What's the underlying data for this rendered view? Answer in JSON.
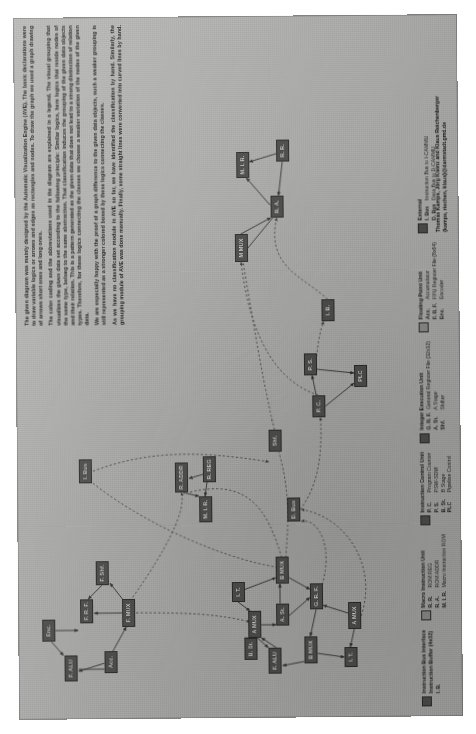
{
  "poster": {
    "title": "CPU Block Diagram (AVE)"
  },
  "description": {
    "paragraphs": [
      "The given diagram was mainly designed by the Automatic Visualization Engine (AVE). The basic declarations were to draw variable logics or arrows and edges as rectangles and nodes. To draw the graph we used a graph drawing of arrows short ones and long ones.",
      "The color coding and the abbreviations used in the diagram are explained in a legend. The visual grouping that visualizes the given data set according to the following principle: Similar logics, here logics that reside nodes of the same type, belong to the same abstraction. That classification induces the grouping of the given data objects and their relation. This is a pattern generated as the given data that does not lead to a strong distinction of relation types. Therefore, for these logics connecting the classes we choose a weaker variation of the nodes of the given data.",
      "We are especially happy with the proof of a graph difference to the given data objects, such a weaker grouping is still represented as a stronger colored boxed by these logics connecting the classes.",
      "As we have no classification module in AVE so far, we have identified the classification by hand. Similarly, the grouping module of AVE was done manually. Finally, some straight lines were converted into curved lines by hand."
    ]
  },
  "credit": {
    "line1": "Thomas Kamps, Jörg Kleinz and Klaus Reichenberger",
    "line2": "{kamps, riechen, klaus}@darmstadt.gmd.de"
  },
  "legend": {
    "groups": [
      {
        "swatch": "dark",
        "title": "Instruction Bus Interface",
        "subtitle": "Instruction Buffer (4x32)",
        "items": [
          {
            "abbr": "I. B.",
            "name": ""
          }
        ]
      },
      {
        "swatch": "light",
        "title": "Macro Instruction Unit",
        "subtitle": "",
        "items": [
          {
            "abbr": "R. R.",
            "name": "ROM REG"
          },
          {
            "abbr": "R. A.",
            "name": "ROM ADDR"
          },
          {
            "abbr": "M. I. R.",
            "name": "Macro Instruction ROM"
          }
        ]
      },
      {
        "swatch": "dark",
        "title": "Instruction Control Unit",
        "subtitle": "",
        "items": [
          {
            "abbr": "P. C.",
            "name": "Program Counter"
          },
          {
            "abbr": "P. S.",
            "name": "PSW-SDW"
          },
          {
            "abbr": "B. St.",
            "name": "B Stage"
          },
          {
            "abbr": "PLC",
            "name": "Pipeline Control"
          }
        ]
      },
      {
        "swatch": "dark",
        "title": "Integer Execution Unit",
        "subtitle": "",
        "items": [
          {
            "abbr": "G. R. F.",
            "name": "General Register File (32x32)"
          },
          {
            "abbr": "A. St.",
            "name": "A Stage"
          },
          {
            "abbr": "Shf.",
            "name": "Shifter"
          }
        ]
      },
      {
        "swatch": "light",
        "title": "Floating Point Unit",
        "subtitle": "",
        "items": [
          {
            "abbr": "Acc.",
            "name": "Accumulator"
          },
          {
            "abbr": "F. R. F.",
            "name": "FPU Register File (8x64)"
          },
          {
            "abbr": "Enc.",
            "name": "Encoder"
          }
        ]
      },
      {
        "swatch": "dark",
        "title": "External",
        "subtitle": "",
        "items": [
          {
            "abbr": "I. Bus",
            "name": "Instruction Bus to I-CAMMU"
          },
          {
            "abbr": "D. Bus",
            "name": "Data Bus to D-CAMMU"
          }
        ]
      }
    ]
  },
  "diagram": {
    "nodes": [
      {
        "id": "n1",
        "label": "F. ALU",
        "x": 38,
        "y": 46,
        "w": 26,
        "h": 13,
        "shade": "dark"
      },
      {
        "id": "n2",
        "label": "Enc.",
        "x": 78,
        "y": 24,
        "w": 22,
        "h": 13,
        "shade": "dark"
      },
      {
        "id": "n3",
        "label": "Acc.",
        "x": 46,
        "y": 86,
        "w": 22,
        "h": 13,
        "shade": "dark"
      },
      {
        "id": "n4",
        "label": "F. R. F.",
        "x": 96,
        "y": 62,
        "w": 24,
        "h": 13,
        "shade": "dark"
      },
      {
        "id": "n5",
        "label": "F. MUX",
        "x": 92,
        "y": 104,
        "w": 28,
        "h": 13,
        "shade": "dark"
      },
      {
        "id": "n6",
        "label": "F. Shf.",
        "x": 134,
        "y": 78,
        "w": 24,
        "h": 13,
        "shade": "dark"
      },
      {
        "id": "n7",
        "label": "I. Bus",
        "x": 236,
        "y": 62,
        "w": 24,
        "h": 13,
        "shade": "dark"
      },
      {
        "id": "n8",
        "label": "R. ADDR",
        "x": 226,
        "y": 158,
        "w": 30,
        "h": 13,
        "shade": "dark"
      },
      {
        "id": "n9",
        "label": "M. I. R.",
        "x": 196,
        "y": 182,
        "w": 26,
        "h": 13,
        "shade": "dark"
      },
      {
        "id": "n10",
        "label": "R. REG",
        "x": 236,
        "y": 186,
        "w": 26,
        "h": 13,
        "shade": "dark"
      },
      {
        "id": "n11",
        "label": "B. St.",
        "x": 58,
        "y": 226,
        "w": 22,
        "h": 13,
        "shade": "dark"
      },
      {
        "id": "n12",
        "label": "I. T.",
        "x": 116,
        "y": 214,
        "w": 20,
        "h": 13,
        "shade": "dark"
      },
      {
        "id": "n13",
        "label": "A MUX",
        "x": 80,
        "y": 230,
        "w": 27,
        "h": 13,
        "shade": "dark"
      },
      {
        "id": "n14",
        "label": "F. ALU",
        "x": 44,
        "y": 250,
        "w": 26,
        "h": 13,
        "shade": "dark"
      },
      {
        "id": "n15",
        "label": "A. St.",
        "x": 92,
        "y": 258,
        "w": 22,
        "h": 13,
        "shade": "dark"
      },
      {
        "id": "n16",
        "label": "B MUX",
        "x": 134,
        "y": 258,
        "w": 27,
        "h": 13,
        "shade": "dark"
      },
      {
        "id": "n17",
        "label": "B MUX",
        "x": 54,
        "y": 286,
        "w": 27,
        "h": 13,
        "shade": "dark"
      },
      {
        "id": "n18",
        "label": "G. R. F.",
        "x": 108,
        "y": 292,
        "w": 26,
        "h": 13,
        "shade": "dark"
      },
      {
        "id": "n19",
        "label": "I. T.",
        "x": 50,
        "y": 326,
        "w": 20,
        "h": 13,
        "shade": "dark"
      },
      {
        "id": "n20",
        "label": "A MUX",
        "x": 88,
        "y": 330,
        "w": 27,
        "h": 13,
        "shade": "dark"
      },
      {
        "id": "n21",
        "label": "D. Bus",
        "x": 196,
        "y": 270,
        "w": 24,
        "h": 13,
        "shade": "dark"
      },
      {
        "id": "n22",
        "label": "Shf.",
        "x": 266,
        "y": 252,
        "w": 22,
        "h": 13,
        "shade": "dark"
      },
      {
        "id": "n23",
        "label": "P. C.",
        "x": 300,
        "y": 296,
        "w": 22,
        "h": 13,
        "shade": "dark"
      },
      {
        "id": "n24",
        "label": "P. S.",
        "x": 342,
        "y": 288,
        "w": 22,
        "h": 13,
        "shade": "dark"
      },
      {
        "id": "n25",
        "label": "PLC",
        "x": 330,
        "y": 338,
        "w": 22,
        "h": 13,
        "shade": "dark"
      },
      {
        "id": "n26",
        "label": "I. B.",
        "x": 396,
        "y": 306,
        "w": 22,
        "h": 13,
        "shade": "dark"
      },
      {
        "id": "n27",
        "label": "M MUX",
        "x": 456,
        "y": 220,
        "w": 28,
        "h": 13,
        "shade": "dark"
      },
      {
        "id": "n28",
        "label": "R. A.",
        "x": 500,
        "y": 256,
        "w": 22,
        "h": 13,
        "shade": "dark"
      },
      {
        "id": "n29",
        "label": "M. I. R.",
        "x": 540,
        "y": 222,
        "w": 26,
        "h": 13,
        "shade": "dark"
      },
      {
        "id": "n30",
        "label": "R. R.",
        "x": 556,
        "y": 262,
        "w": 22,
        "h": 13,
        "shade": "dark"
      }
    ]
  }
}
